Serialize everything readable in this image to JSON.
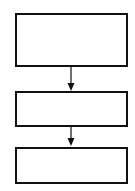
{
  "diagram": {
    "type": "flowchart",
    "stroke_color": "#111111",
    "background": "#ffffff",
    "nodes": [
      {
        "id": "box-1",
        "label": "",
        "x": 16,
        "y": 14,
        "w": 111,
        "h": 52
      },
      {
        "id": "box-2",
        "label": "",
        "x": 16,
        "y": 92,
        "w": 111,
        "h": 34
      },
      {
        "id": "box-3",
        "label": "",
        "x": 16,
        "y": 148,
        "w": 111,
        "h": 35
      }
    ],
    "edges": [
      {
        "from": "box-1",
        "to": "box-2",
        "direction": "down"
      },
      {
        "from": "box-2",
        "to": "box-3",
        "direction": "down"
      }
    ]
  }
}
